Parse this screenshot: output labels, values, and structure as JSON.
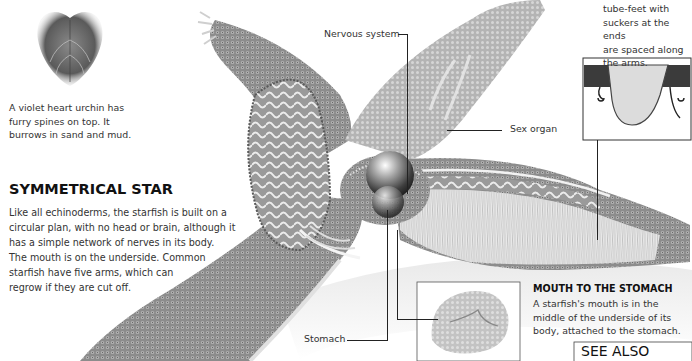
{
  "page": {
    "urchin": {
      "caption": [
        "A violet heart urchin has",
        "furry spines on top. It",
        "burrows in sand and mud."
      ]
    },
    "symmetrical_star": {
      "title": "SYMMETRICAL STAR",
      "body": [
        "Like all echinoderms, the starfish is built on a",
        "circular plan, with no head or brain, although it",
        "has a simple network of nerves in its body.",
        "The mouth is on the underside. Common",
        "starfish have five arms, which can",
        "regrow if they are cut off."
      ]
    },
    "tube_feet": {
      "caption": [
        "tube-feet with",
        "suckers at the ends",
        "are spaced along",
        "the arms."
      ]
    },
    "labels": {
      "nervous_system": "Nervous system",
      "sex_organ": "Sex organ",
      "stomach": "Stomach"
    },
    "mouth_to_stomach": {
      "title": "MOUTH TO THE STOMACH",
      "body": [
        "A starfish's mouth is in the",
        "middle of the underside of its",
        "body, attached to the stomach."
      ]
    },
    "see_also": {
      "title": "SEE ALSO"
    }
  },
  "colors": {
    "ink": "#222222",
    "arm_mid": "#8a8a8a",
    "arm_dark": "#5e5e5e",
    "arm_light": "#c8c8c8",
    "background": "#ffffff"
  }
}
